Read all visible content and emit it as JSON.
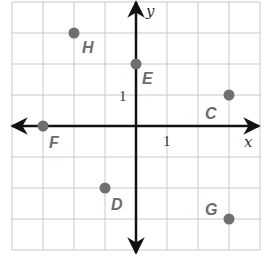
{
  "diagram": {
    "type": "coordinate-plane",
    "axes": {
      "x_label": "x",
      "y_label": "y",
      "x_tick_label": "1",
      "y_tick_label": "1"
    },
    "grid": {
      "x_range": [
        -4,
        4
      ],
      "y_range": [
        -4,
        4
      ]
    },
    "colors": {
      "grid": "#c8c8c8",
      "axis": "#111111",
      "point": "#6f6f6f",
      "label": "#6b6b6b"
    },
    "points": [
      {
        "name": "H",
        "x": -2,
        "y": 3
      },
      {
        "name": "E",
        "x": 0,
        "y": 2
      },
      {
        "name": "C",
        "x": 3,
        "y": 1
      },
      {
        "name": "F",
        "x": -3,
        "y": 0
      },
      {
        "name": "D",
        "x": -1,
        "y": -2
      },
      {
        "name": "G",
        "x": 3,
        "y": -3
      }
    ]
  }
}
